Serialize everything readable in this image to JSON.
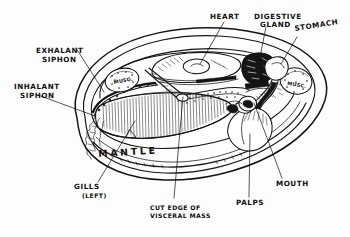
{
  "figure": {
    "ink_color": "#141414",
    "paper_color": "#fdfdfd"
  },
  "labels": {
    "heart": "HEART",
    "digestive_gland_line1": "DIGESTIVE",
    "digestive_gland_line2": "GLAND",
    "stomach": "STOMACH",
    "exhalant_line1": "EXHALANT",
    "exhalant_line2": "SIPHON",
    "inhalant_line1": "INHALANT",
    "inhalant_line2": "SIPHON",
    "mantle": "MANTLE",
    "gills_line1": "GILLS",
    "gills_line2": "(LEFT)",
    "cut_edge_line1": "CUT EDGE OF",
    "cut_edge_line2": "VISCERAL MASS",
    "palps": "PALPS",
    "mouth": "MOUTH",
    "muscle_anterior": "MUSC.",
    "muscle_posterior": "MUSC."
  }
}
